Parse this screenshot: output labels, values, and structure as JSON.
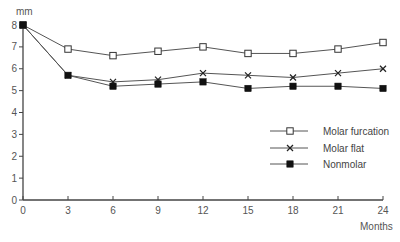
{
  "chart_data": {
    "type": "line",
    "title": "",
    "xlabel": "Months",
    "ylabel": "mm",
    "x": [
      0,
      3,
      6,
      9,
      12,
      15,
      18,
      21,
      24
    ],
    "xlim": [
      0,
      24
    ],
    "ylim": [
      0,
      8
    ],
    "xticks": [
      0,
      3,
      6,
      9,
      12,
      15,
      18,
      21,
      24
    ],
    "yticks": [
      0,
      1,
      2,
      3,
      4,
      5,
      6,
      7,
      8
    ],
    "grid": false,
    "legend_position": "lower right (inside plot)",
    "series": [
      {
        "name": "Molar furcation",
        "marker": "open-square",
        "values": [
          8.0,
          6.9,
          6.6,
          6.8,
          7.0,
          6.7,
          6.7,
          6.9,
          7.2
        ]
      },
      {
        "name": "Molar flat",
        "marker": "x",
        "values": [
          8.0,
          5.7,
          5.4,
          5.5,
          5.8,
          5.7,
          5.6,
          5.8,
          6.0
        ]
      },
      {
        "name": "Nonmolar",
        "marker": "filled-square",
        "values": [
          8.0,
          5.7,
          5.2,
          5.3,
          5.4,
          5.1,
          5.2,
          5.2,
          5.1
        ]
      }
    ]
  },
  "colors": {
    "line": "#555555",
    "axis": "#444444",
    "marker_fill": "#111111"
  }
}
